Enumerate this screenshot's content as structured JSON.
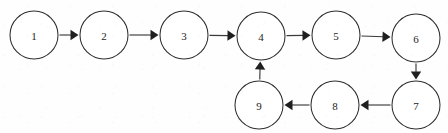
{
  "diagram": {
    "type": "directed-graph",
    "background_color": "#fefefe",
    "stroke_color": "#2f2f2f",
    "arrow_color": "#1f1f1f",
    "node_radius": 24,
    "nodes": [
      {
        "id": "1",
        "label": "1",
        "cx": 34,
        "cy": 35
      },
      {
        "id": "2",
        "label": "2",
        "cx": 104,
        "cy": 35
      },
      {
        "id": "3",
        "label": "3",
        "cx": 184,
        "cy": 35
      },
      {
        "id": "4",
        "label": "4",
        "cx": 261,
        "cy": 36
      },
      {
        "id": "5",
        "label": "5",
        "cx": 336,
        "cy": 35
      },
      {
        "id": "6",
        "label": "6",
        "cx": 416,
        "cy": 38
      },
      {
        "id": "7",
        "label": "7",
        "cx": 416,
        "cy": 105
      },
      {
        "id": "8",
        "label": "8",
        "cx": 335,
        "cy": 105
      },
      {
        "id": "9",
        "label": "9",
        "cx": 259,
        "cy": 105
      }
    ],
    "edges": [
      {
        "from": "1",
        "to": "2",
        "direction": "right"
      },
      {
        "from": "2",
        "to": "3",
        "direction": "right"
      },
      {
        "from": "3",
        "to": "4",
        "direction": "right"
      },
      {
        "from": "4",
        "to": "5",
        "direction": "right"
      },
      {
        "from": "5",
        "to": "6",
        "direction": "right"
      },
      {
        "from": "6",
        "to": "7",
        "direction": "down"
      },
      {
        "from": "7",
        "to": "8",
        "direction": "left"
      },
      {
        "from": "8",
        "to": "9",
        "direction": "left"
      },
      {
        "from": "9",
        "to": "4",
        "direction": "up"
      }
    ]
  }
}
